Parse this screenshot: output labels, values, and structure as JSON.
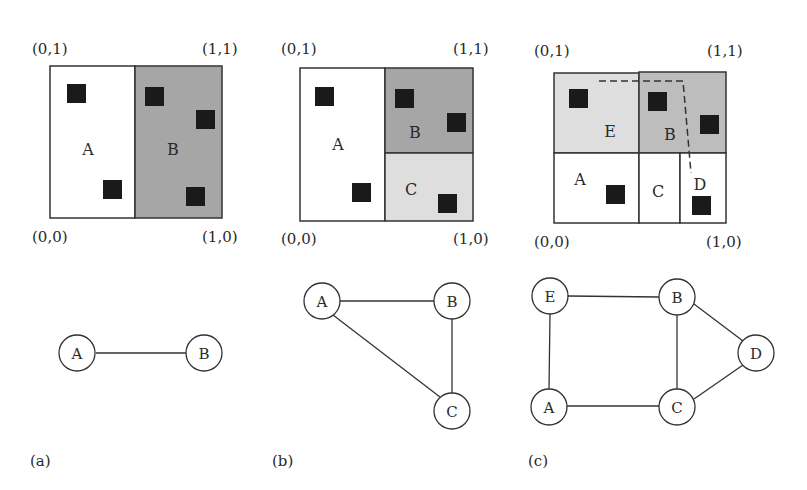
{
  "corner_labels": {
    "tl": "(0,1)",
    "tr": "(1,1)",
    "bl": "(0,0)",
    "br": "(1,0)"
  },
  "colors": {
    "white": "#ffffff",
    "dark_gray": "#a6a6a6",
    "light_gray": "#dedede",
    "object": "#1a1a1a",
    "stroke": "#333333"
  },
  "panels": [
    {
      "caption": "(a)",
      "regions": [
        {
          "label": "A",
          "fill": "white"
        },
        {
          "label": "B",
          "fill": "dark_gray"
        }
      ],
      "graph": {
        "nodes": [
          "A",
          "B"
        ],
        "edges": [
          [
            "A",
            "B"
          ]
        ]
      }
    },
    {
      "caption": "(b)",
      "regions": [
        {
          "label": "A",
          "fill": "white"
        },
        {
          "label": "B",
          "fill": "dark_gray"
        },
        {
          "label": "C",
          "fill": "light_gray"
        }
      ],
      "graph": {
        "nodes": [
          "A",
          "B",
          "C"
        ],
        "edges": [
          [
            "A",
            "B"
          ],
          [
            "A",
            "C"
          ],
          [
            "B",
            "C"
          ]
        ]
      }
    },
    {
      "caption": "(c)",
      "regions": [
        {
          "label": "E",
          "fill": "light_gray"
        },
        {
          "label": "B",
          "fill": "dark_gray"
        },
        {
          "label": "A",
          "fill": "white"
        },
        {
          "label": "C",
          "fill": "white"
        },
        {
          "label": "D",
          "fill": "white"
        }
      ],
      "graph": {
        "nodes": [
          "E",
          "B",
          "D",
          "A",
          "C"
        ],
        "edges": [
          [
            "E",
            "B"
          ],
          [
            "E",
            "A"
          ],
          [
            "B",
            "C"
          ],
          [
            "B",
            "D"
          ],
          [
            "A",
            "C"
          ],
          [
            "C",
            "D"
          ]
        ]
      }
    }
  ]
}
